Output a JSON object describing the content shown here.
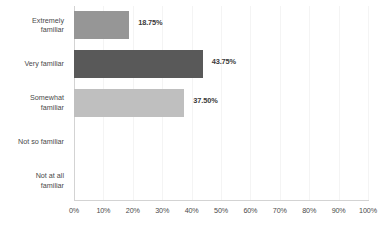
{
  "chart_data": {
    "type": "bar",
    "orientation": "horizontal",
    "title": "",
    "xlabel": "",
    "ylabel": "",
    "categories": [
      "Extremely familiar",
      "Very familiar",
      "Somewhat familiar",
      "Not so familiar",
      "Not at all familiar"
    ],
    "category_lines": [
      [
        "Extremely",
        "familiar"
      ],
      [
        "Very familiar"
      ],
      [
        "Somewhat",
        "familiar"
      ],
      [
        "Not so familiar"
      ],
      [
        "Not at all",
        "familiar"
      ]
    ],
    "values": [
      18.75,
      43.75,
      37.5,
      0,
      0
    ],
    "value_labels": [
      "18.75%",
      "43.75%",
      "37.50%",
      "",
      ""
    ],
    "bar_colors": [
      "#969696",
      "#595959",
      "#bfbfbf",
      "#bfbfbf",
      "#bfbfbf"
    ],
    "xlim": [
      0,
      100
    ],
    "xticks": [
      0,
      10,
      20,
      30,
      40,
      50,
      60,
      70,
      80,
      90,
      100
    ],
    "xtick_labels": [
      "0%",
      "10%",
      "20%",
      "30%",
      "40%",
      "50%",
      "60%",
      "70%",
      "80%",
      "90%",
      "100%"
    ],
    "grid": true,
    "grid_color": "#f4f4f4",
    "axis_color": "#d3d3d3",
    "legend": null,
    "background": "#ffffff"
  }
}
